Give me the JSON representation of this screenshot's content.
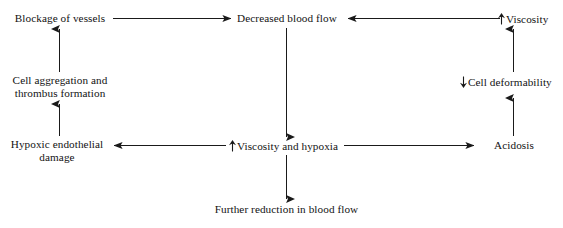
{
  "diagram": {
    "type": "flowchart",
    "stroke_color": "#1a1a1a",
    "text_color": "#121212",
    "background": "#ffffff",
    "nodes": [
      {
        "id": "blockage",
        "label": "Blockage of vessels",
        "direction_marker": "none"
      },
      {
        "id": "decreased-blood-flow",
        "label": "Decreased blood flow",
        "direction_marker": "none"
      },
      {
        "id": "viscosity",
        "label": "Viscosity",
        "direction_marker": "up"
      },
      {
        "id": "cell-aggregation",
        "label_line1": "Cell aggregation and",
        "label_line2": "thrombus formation",
        "direction_marker": "none"
      },
      {
        "id": "cell-deformability",
        "label": "Cell deformability",
        "direction_marker": "down"
      },
      {
        "id": "hypoxic-endothelial-damage",
        "label_line1": "Hypoxic endothelial",
        "label_line2": "damage",
        "direction_marker": "none"
      },
      {
        "id": "viscosity-and-hypoxia",
        "label": "Viscosity and hypoxia",
        "direction_marker": "up"
      },
      {
        "id": "acidosis",
        "label": "Acidosis",
        "direction_marker": "none"
      },
      {
        "id": "further-reduction",
        "label": "Further reduction in blood flow",
        "direction_marker": "none"
      }
    ],
    "edges": [
      {
        "from": "blockage",
        "to": "decreased-blood-flow",
        "orientation": "horizontal",
        "arrow": "right"
      },
      {
        "from": "viscosity",
        "to": "decreased-blood-flow",
        "orientation": "horizontal",
        "arrow": "left"
      },
      {
        "from": "decreased-blood-flow",
        "to": "viscosity-and-hypoxia",
        "orientation": "vertical",
        "arrow": "down"
      },
      {
        "from": "cell-aggregation",
        "to": "blockage",
        "orientation": "vertical",
        "arrow": "up"
      },
      {
        "from": "hypoxic-endothelial-damage",
        "to": "cell-aggregation",
        "orientation": "vertical",
        "arrow": "up"
      },
      {
        "from": "viscosity-and-hypoxia",
        "to": "hypoxic-endothelial-damage",
        "orientation": "horizontal",
        "arrow": "left"
      },
      {
        "from": "viscosity-and-hypoxia",
        "to": "acidosis",
        "orientation": "horizontal",
        "arrow": "right"
      },
      {
        "from": "acidosis",
        "to": "cell-deformability",
        "orientation": "vertical",
        "arrow": "up"
      },
      {
        "from": "cell-deformability",
        "to": "viscosity",
        "orientation": "vertical",
        "arrow": "up"
      },
      {
        "from": "viscosity-and-hypoxia",
        "to": "further-reduction",
        "orientation": "vertical",
        "arrow": "down"
      }
    ]
  }
}
